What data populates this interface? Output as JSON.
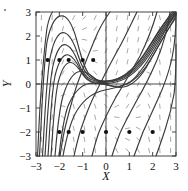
{
  "figure": {
    "corner_mark": "·"
  },
  "axes": {
    "xlabel": "X",
    "ylabel": "Y",
    "xticks": [
      "-3",
      "-2",
      "-1",
      "0",
      "1",
      "2",
      "3"
    ],
    "yticks": [
      "3",
      "2",
      "1",
      "0",
      "-1",
      "-2",
      "-3"
    ],
    "xlim": [
      -3,
      3
    ],
    "ylim": [
      -3,
      3
    ]
  },
  "chart_data": {
    "type": "line",
    "title": "",
    "subtitle": "",
    "xlabel": "X",
    "ylabel": "Y",
    "xlim": [
      -3,
      3
    ],
    "ylim": [
      -3,
      3
    ],
    "xticks": [
      -3,
      -2,
      -1,
      0,
      1,
      2,
      3
    ],
    "yticks": [
      -3,
      -2,
      -1,
      0,
      1,
      2,
      3
    ],
    "grid": false,
    "legend": "none",
    "plot_kind": "direction-field-with-solution-curves",
    "direction_field": {
      "style": "short gray dashes",
      "color": "#9a9a9a",
      "nx": 13,
      "ny": 13,
      "slope_formula": "dy/dx = x^2 + y^2 - ... (hash marks show local slope)"
    },
    "initial_condition_markers": {
      "color": "#111111",
      "marker": "filled circle",
      "points": [
        {
          "x": -2.5,
          "y": 1
        },
        {
          "x": -2.0,
          "y": 1
        },
        {
          "x": -1.6,
          "y": 1
        },
        {
          "x": -1.0,
          "y": 1
        },
        {
          "x": -0.55,
          "y": 1
        },
        {
          "x": -2.0,
          "y": -2
        },
        {
          "x": -1.6,
          "y": -2
        },
        {
          "x": -1.0,
          "y": -2
        },
        {
          "x": 0.0,
          "y": -2
        },
        {
          "x": 1.0,
          "y": -2
        },
        {
          "x": 2.0,
          "y": -2
        }
      ]
    },
    "series": [
      {
        "name": "trajectory-1",
        "comment": "rises steeply from lower-left, peaks near (-1.75, 2.85), descends through saddle region toward upper-right"
      },
      {
        "name": "trajectory-2",
        "comment": "peak near (-1.7, 1.95)"
      },
      {
        "name": "trajectory-3",
        "comment": "peak near (-1.65, 1.45)"
      },
      {
        "name": "trajectory-4",
        "comment": "peak near (-1.6, 1.15)"
      },
      {
        "name": "trajectory-5",
        "comment": "peak near (-1.55, 1.0)"
      },
      {
        "name": "trajectory-6",
        "comment": "low arc through (-1, 0.55) flattening toward y=0"
      },
      {
        "name": "trajectory-7",
        "comment": "bundle converging toward (0.8, 0.2) then rising steeply to upper right"
      },
      {
        "name": "trajectory-8",
        "comment": "from (-2,-2) rising nearly vertically"
      },
      {
        "name": "trajectory-9",
        "comment": "from (-1.6,-2) rising nearly vertically"
      },
      {
        "name": "trajectory-10",
        "comment": "from (-1,-2) rising steeply"
      },
      {
        "name": "trajectory-11",
        "comment": "from (0,-2) rising steeply"
      },
      {
        "name": "trajectory-12",
        "comment": "from (1,-2) rising steeply"
      },
      {
        "name": "trajectory-13",
        "comment": "from (2,-2) rising steeply at right edge"
      }
    ]
  },
  "colors": {
    "trajectory": "#3a3a3a",
    "field": "#9a9a9a",
    "marker": "#111111",
    "frame": "#444444",
    "background": "#ffffff"
  }
}
